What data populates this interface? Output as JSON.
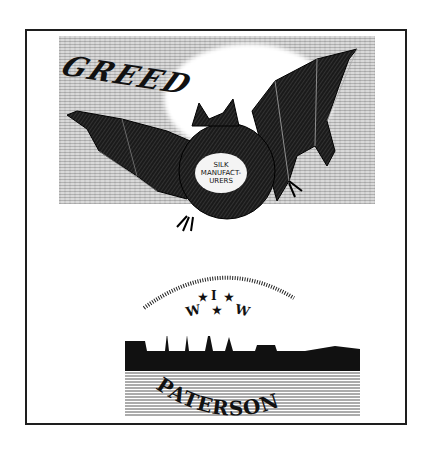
{
  "illustration": {
    "title_banner": "GREED",
    "badge": {
      "lines": [
        "SILK",
        "MANUFACT-",
        "URERS"
      ]
    },
    "emblem": {
      "letters": [
        "I",
        "W",
        "W"
      ],
      "stars": 3
    },
    "city_label": "PATERSON"
  },
  "colors": {
    "ink": "#111111",
    "paper": "#ffffff",
    "frame": "#1e1e1e"
  }
}
